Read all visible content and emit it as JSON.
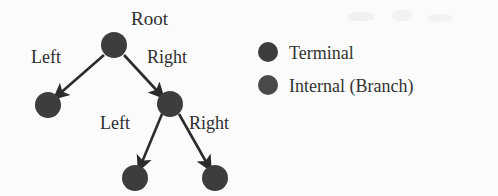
{
  "figure": {
    "background_color": "#fbfbfb",
    "width": 498,
    "height": 196
  },
  "diagram": {
    "type": "tree",
    "node_color": "#3d3d3d",
    "edge_color": "#2b2b2b",
    "node_radius": 13,
    "nodes": [
      {
        "id": "root",
        "label": "Root",
        "kind": "Internal (Branch)",
        "cx": 114,
        "cy": 45,
        "r": 13
      },
      {
        "id": "n-l",
        "label": "",
        "kind": "Terminal",
        "cx": 48,
        "cy": 105,
        "r": 13
      },
      {
        "id": "n-r",
        "label": "",
        "kind": "Internal (Branch)",
        "cx": 170,
        "cy": 104,
        "r": 13
      },
      {
        "id": "n-rl",
        "label": "",
        "kind": "Terminal",
        "cx": 135,
        "cy": 178,
        "r": 13
      },
      {
        "id": "n-rr",
        "label": "",
        "kind": "Terminal",
        "cx": 215,
        "cy": 178,
        "r": 13
      }
    ],
    "edges": [
      {
        "id": "e-root-left",
        "from": "root",
        "to": "n-l",
        "label": "Left",
        "x1": 104,
        "y1": 55,
        "x2": 57,
        "y2": 96
      },
      {
        "id": "e-root-right",
        "from": "root",
        "to": "n-r",
        "label": "Right",
        "x1": 124,
        "y1": 55,
        "x2": 161,
        "y2": 95
      },
      {
        "id": "e-n-r-left",
        "from": "n-r",
        "to": "n-rl",
        "label": "Left",
        "x1": 162,
        "y1": 114,
        "x2": 140,
        "y2": 167
      },
      {
        "id": "e-n-r-right",
        "from": "n-r",
        "to": "n-rr",
        "label": "Right",
        "x1": 179,
        "y1": 114,
        "x2": 209,
        "y2": 167
      }
    ],
    "root_label": "Root",
    "edge_labels": {
      "root_left": "Left",
      "root_right": "Right",
      "branch_left": "Left",
      "branch_right": "Right"
    }
  },
  "legend": {
    "dot_radius": 10,
    "items": [
      {
        "label": "Terminal",
        "color": "#3d3d3d",
        "cx": 268,
        "cy": 52
      },
      {
        "label": "Internal (Branch)",
        "color": "#4a4a4a",
        "cx": 268,
        "cy": 85
      }
    ]
  }
}
